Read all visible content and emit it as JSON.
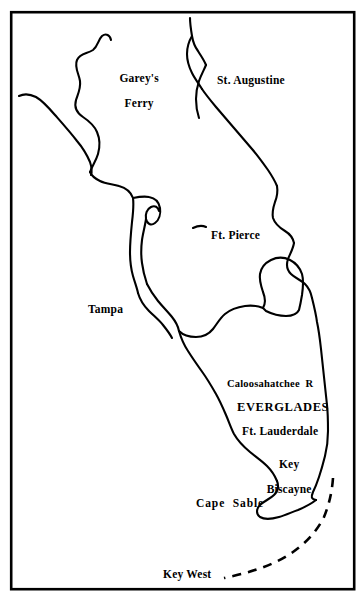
{
  "map": {
    "title": "Map of Florida",
    "background_color": "#ffffff",
    "ink_color": "#000000",
    "frame": {
      "name": "map-border-frame",
      "x": 10,
      "y": 11,
      "width": 345,
      "height": 579,
      "stroke_width": 2.5
    },
    "labels": [
      {
        "id": "gareys-ferry",
        "text": "Garey's\nFerry",
        "x": 133,
        "y": 69,
        "size": 11.5,
        "align": "center"
      },
      {
        "id": "st-augustine",
        "text": "St. Augustine",
        "x": 217,
        "y": 81,
        "size": 11.5,
        "align": "left"
      },
      {
        "id": "ft-pierce",
        "text": "Ft. Pierce",
        "x": 211,
        "y": 236,
        "size": 11.5,
        "align": "left"
      },
      {
        "id": "tampa",
        "text": "Tampa",
        "x": 88,
        "y": 310,
        "size": 11.5,
        "align": "left"
      },
      {
        "id": "caloosahatchee-r",
        "text": "Caloosahatchee  R",
        "x": 227,
        "y": 384,
        "size": 10.5,
        "align": "left"
      },
      {
        "id": "everglades",
        "text": "EVERGLADES",
        "x": 237,
        "y": 403,
        "size": 12.5,
        "align": "left"
      },
      {
        "id": "ft-lauderdale",
        "text": "Ft. Lauderdale",
        "x": 242,
        "y": 427,
        "size": 11.5,
        "align": "left"
      },
      {
        "id": "key-biscayne",
        "text": "Key\nBiscayne",
        "x": 283,
        "y": 448,
        "size": 11.5,
        "align": "center"
      },
      {
        "id": "cape-sable",
        "text": "Cape  Sable",
        "x": 196,
        "y": 500,
        "size": 11.5,
        "align": "left"
      },
      {
        "id": "key-west",
        "text": "Key West",
        "x": 163,
        "y": 569,
        "size": 11.5,
        "align": "left"
      }
    ],
    "features": [
      {
        "id": "st-johns-river",
        "name": "river-st-johns",
        "type": "line",
        "label": "St. Johns River system near Garey's Ferry"
      },
      {
        "id": "northwest-coast",
        "name": "coastline-northwest",
        "type": "line",
        "label": "Gulf coast running southeast from map edge"
      },
      {
        "id": "east-coast",
        "name": "coastline-east",
        "type": "line",
        "label": "Atlantic coast from St. Augustine to Key Biscayne"
      },
      {
        "id": "st-augustine-inlet",
        "name": "inlet-st-augustine",
        "type": "line",
        "label": "Barrier island / inlet at St. Augustine"
      },
      {
        "id": "gulf-coast",
        "name": "coastline-gulf",
        "type": "line",
        "label": "Gulf coast from Tampa Bay to Cape Sable"
      },
      {
        "id": "tampa-bay",
        "name": "bay-tampa",
        "type": "line",
        "label": "Tampa Bay notch"
      },
      {
        "id": "lake-okeechobee",
        "name": "lake-okeechobee",
        "type": "closed",
        "label": "Lake Okeechobee"
      },
      {
        "id": "caloosahatchee-river",
        "name": "river-caloosahatchee",
        "type": "line",
        "label": "Caloosahatchee River outflow to gulf"
      },
      {
        "id": "florida-keys",
        "name": "island-chain-keys",
        "type": "dashed",
        "label": "Florida Keys chain to Key West"
      }
    ]
  }
}
